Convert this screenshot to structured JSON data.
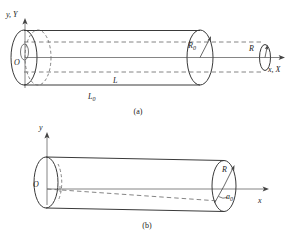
{
  "figure": {
    "background": "#ffffff",
    "line_color": "#3a3a3a",
    "dash_color": "#555555",
    "text_color": "#1a1a1a"
  },
  "panel_a": {
    "caption": "(a)",
    "axis_y_label": "y, Y",
    "axis_x_label": "x, X",
    "origin_label": "O",
    "radius_label": "R",
    "radius_label_sub": "0",
    "radius_small_label": "R",
    "length_label": "L",
    "length_initial_label": "L",
    "length_initial_sub": "0"
  },
  "panel_b": {
    "caption": "(b)",
    "axis_y_label": "y",
    "axis_x_label": "x",
    "origin_label": "O",
    "radius_label": "R",
    "angle_label": "a",
    "angle_sub": "0"
  }
}
